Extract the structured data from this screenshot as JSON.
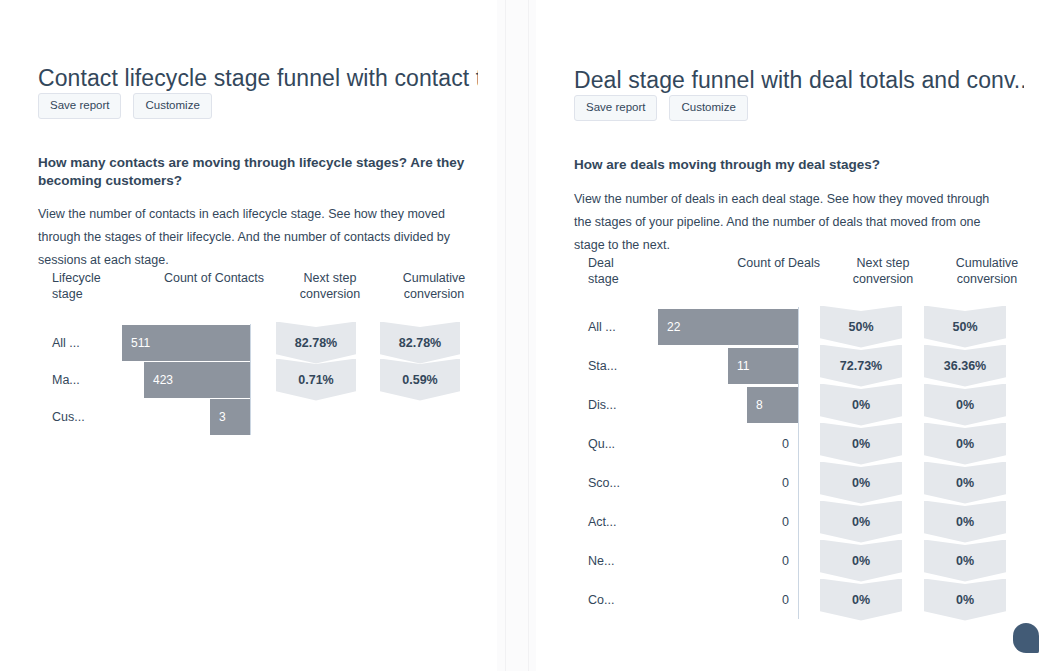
{
  "theme": {
    "background": "#ffffff",
    "text": "#33475b",
    "bar_fill": "#8d949e",
    "chevron_fill": "#e5e8ec",
    "button_bg": "#f5f8fa",
    "button_border": "#dfe3eb",
    "axis_line": "#cbd6e2"
  },
  "panels": [
    {
      "id": "contact-lifecycle-funnel",
      "title": "Contact lifecycle stage funnel with contact t...",
      "buttons": {
        "save": "Save report",
        "customize": "Customize"
      },
      "question": "How many contacts are moving through lifecycle stages? Are they becoming customers?",
      "description": "View the number of contacts in each lifecycle stage. See how they moved through the stages of their lifecycle. And the number of contacts divided by sessions at each stage.",
      "chart_data": {
        "type": "bar",
        "title": "Contact lifecycle stage funnel with contact t...",
        "xlabel": "",
        "ylabel": "",
        "columns": [
          "Lifecycle stage",
          "Count of Contacts",
          "Next step conversion",
          "Cumulative conversion"
        ],
        "column_headers": [
          {
            "line1": "Lifecycle",
            "line2": "stage"
          },
          {
            "line1": "Count of Contacts",
            "line2": ""
          },
          {
            "line1": "Next step",
            "line2": "conversion"
          },
          {
            "line1": "Cumulative",
            "line2": "conversion"
          }
        ],
        "categories": [
          "All ...",
          "Ma...",
          "Cus..."
        ],
        "values": [
          511,
          423,
          3
        ],
        "max_value": 511,
        "series": [
          {
            "name": "Count of Contacts",
            "values": [
              511,
              423,
              3
            ]
          },
          {
            "name": "Next step conversion",
            "values": [
              "82.78%",
              "0.71%",
              ""
            ]
          },
          {
            "name": "Cumulative conversion",
            "values": [
              "82.78%",
              "0.59%",
              ""
            ]
          }
        ],
        "rows": [
          {
            "stage": "All ...",
            "count": "511",
            "count_value": 511,
            "next_step": "82.78%",
            "cumulative": "82.78%"
          },
          {
            "stage": "Ma...",
            "count": "423",
            "count_value": 423,
            "next_step": "0.71%",
            "cumulative": "0.59%"
          },
          {
            "stage": "Cus...",
            "count": "3",
            "count_value": 3,
            "next_step": "",
            "cumulative": ""
          }
        ]
      }
    },
    {
      "id": "deal-stage-funnel",
      "title": "Deal stage funnel with deal totals and conv...",
      "buttons": {
        "save": "Save report",
        "customize": "Customize"
      },
      "question": "How are deals moving through my deal stages?",
      "description": "View the number of deals in each deal stage. See how they moved through the stages of your pipeline. And the number of deals that moved from one stage to the next.",
      "chart_data": {
        "type": "bar",
        "title": "Deal stage funnel with deal totals and conv...",
        "xlabel": "",
        "ylabel": "",
        "columns": [
          "Deal stage",
          "Count of Deals",
          "Next step conversion",
          "Cumulative conversion"
        ],
        "column_headers": [
          {
            "line1": "Deal",
            "line2": "stage"
          },
          {
            "line1": "Count of Deals",
            "line2": ""
          },
          {
            "line1": "Next step",
            "line2": "conversion"
          },
          {
            "line1": "Cumulative",
            "line2": "conversion"
          }
        ],
        "categories": [
          "All ...",
          "Sta...",
          "Dis...",
          "Qu...",
          "Sco...",
          "Act...",
          "Ne...",
          "Co..."
        ],
        "values": [
          22,
          11,
          8,
          0,
          0,
          0,
          0,
          0
        ],
        "max_value": 22,
        "series": [
          {
            "name": "Count of Deals",
            "values": [
              22,
              11,
              8,
              0,
              0,
              0,
              0,
              0
            ]
          },
          {
            "name": "Next step conversion",
            "values": [
              "50%",
              "72.73%",
              "0%",
              "0%",
              "0%",
              "0%",
              "0%",
              "0%"
            ]
          },
          {
            "name": "Cumulative conversion",
            "values": [
              "50%",
              "36.36%",
              "0%",
              "0%",
              "0%",
              "0%",
              "0%",
              "0%"
            ]
          }
        ],
        "rows": [
          {
            "stage": "All ...",
            "count": "22",
            "count_value": 22,
            "next_step": "50%",
            "cumulative": "50%"
          },
          {
            "stage": "Sta...",
            "count": "11",
            "count_value": 11,
            "next_step": "72.73%",
            "cumulative": "36.36%"
          },
          {
            "stage": "Dis...",
            "count": "8",
            "count_value": 8,
            "next_step": "0%",
            "cumulative": "0%"
          },
          {
            "stage": "Qu...",
            "count": "0",
            "count_value": 0,
            "next_step": "0%",
            "cumulative": "0%"
          },
          {
            "stage": "Sco...",
            "count": "0",
            "count_value": 0,
            "next_step": "0%",
            "cumulative": "0%"
          },
          {
            "stage": "Act...",
            "count": "0",
            "count_value": 0,
            "next_step": "0%",
            "cumulative": "0%"
          },
          {
            "stage": "Ne...",
            "count": "0",
            "count_value": 0,
            "next_step": "0%",
            "cumulative": "0%"
          },
          {
            "stage": "Co...",
            "count": "0",
            "count_value": 0,
            "next_step": "0%",
            "cumulative": "0%"
          }
        ]
      }
    }
  ],
  "chat_widget": {
    "icon": "chat-bubble-icon"
  }
}
